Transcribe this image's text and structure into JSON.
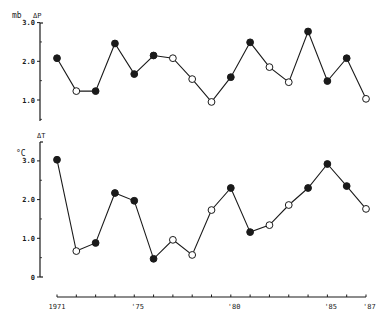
{
  "chart_data": [
    {
      "type": "line",
      "title": "",
      "variable_label": "ΔP",
      "unit_label": "mb",
      "xlabel": "",
      "ylabel": "mb ΔP",
      "x": [
        1971,
        1972,
        1973,
        1974,
        1975,
        1976,
        1977,
        1978,
        1979,
        1980,
        1981,
        1982,
        1983,
        1984,
        1985,
        1986,
        1987
      ],
      "values": [
        2.08,
        1.23,
        1.23,
        2.46,
        1.67,
        2.15,
        2.08,
        1.54,
        0.95,
        1.59,
        2.49,
        1.85,
        1.46,
        2.77,
        1.49,
        2.08,
        1.03
      ],
      "marker_filled": [
        true,
        false,
        true,
        true,
        true,
        true,
        false,
        false,
        false,
        true,
        true,
        false,
        false,
        true,
        true,
        true,
        false
      ],
      "yticks": [
        1.0,
        2.0,
        3.0
      ],
      "ytick_labels": [
        "1.0",
        "2.0",
        "3.0"
      ],
      "ylim": [
        0.45,
        3.0
      ],
      "grid": false,
      "legend": null
    },
    {
      "type": "line",
      "title": "",
      "variable_label": "ΔT",
      "unit_label": "°C",
      "xlabel": "",
      "ylabel": "°C ΔT",
      "x": [
        1971,
        1972,
        1973,
        1974,
        1975,
        1976,
        1977,
        1978,
        1979,
        1980,
        1981,
        1982,
        1983,
        1984,
        1985,
        1986,
        1987
      ],
      "values": [
        3.03,
        0.67,
        0.88,
        2.17,
        1.97,
        0.47,
        0.96,
        0.57,
        1.73,
        2.3,
        1.16,
        1.34,
        1.86,
        2.3,
        2.92,
        2.35,
        1.76
      ],
      "marker_filled": [
        true,
        false,
        true,
        true,
        true,
        true,
        false,
        false,
        false,
        true,
        true,
        false,
        false,
        true,
        true,
        true,
        false
      ],
      "yticks": [
        0,
        1.0,
        2.0,
        3.0
      ],
      "ytick_labels": [
        "0",
        "1.0",
        "2.0",
        "3.0"
      ],
      "ylim": [
        0,
        3.5
      ],
      "grid": false,
      "legend": null
    }
  ],
  "x_axis": {
    "start": 1971,
    "end": 1987,
    "tick_labels": [
      {
        "year": 1971,
        "label": "1971"
      },
      {
        "year": 1975,
        "label": "'75"
      },
      {
        "year": 1980,
        "label": "'80"
      },
      {
        "year": 1985,
        "label": "'85"
      },
      {
        "year": 1987,
        "label": "'87"
      }
    ]
  },
  "colors": {
    "ink": "#1a1a1a",
    "background": "#ffffff"
  }
}
